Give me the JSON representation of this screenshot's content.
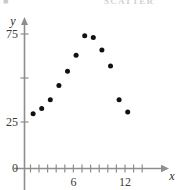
{
  "header": {
    "left_fragment": "■",
    "right_fragment": "SCATTER"
  },
  "axis_names": {
    "x": "x",
    "y": "y"
  },
  "colors": {
    "axis": "#8e8e8e",
    "point": "#111111",
    "label": "#3a3a3a",
    "background": "#ffffff"
  },
  "chart_data": {
    "type": "scatter",
    "title": "",
    "subtitle": "",
    "xlabel": "x",
    "ylabel": "y",
    "xlim": [
      0,
      14
    ],
    "ylim": [
      0,
      85
    ],
    "grid": false,
    "legend": null,
    "x_ticks": [
      1,
      2,
      3,
      4,
      5,
      6,
      7,
      8,
      9,
      10,
      11,
      12,
      13
    ],
    "x_tick_labels": [
      "",
      "",
      "",
      "",
      "",
      "6",
      "",
      "",
      "",
      "",
      "",
      "12",
      ""
    ],
    "y_ticks": [
      0,
      25,
      50,
      75
    ],
    "y_tick_labels": [
      "0",
      "25",
      "",
      "75"
    ],
    "points": [
      {
        "x": 1,
        "y": 30
      },
      {
        "x": 2,
        "y": 33
      },
      {
        "x": 3,
        "y": 38
      },
      {
        "x": 4,
        "y": 46
      },
      {
        "x": 5,
        "y": 54
      },
      {
        "x": 6,
        "y": 63
      },
      {
        "x": 7,
        "y": 74
      },
      {
        "x": 8,
        "y": 73
      },
      {
        "x": 9,
        "y": 66
      },
      {
        "x": 10,
        "y": 57
      },
      {
        "x": 11,
        "y": 38
      },
      {
        "x": 12,
        "y": 31
      }
    ],
    "series": [
      {
        "name": "data",
        "x": [
          1,
          2,
          3,
          4,
          5,
          6,
          7,
          8,
          9,
          10,
          11,
          12
        ],
        "values": [
          30,
          33,
          38,
          46,
          54,
          63,
          74,
          73,
          66,
          57,
          38,
          31
        ]
      }
    ]
  }
}
